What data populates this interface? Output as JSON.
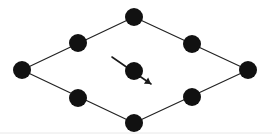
{
  "figure": {
    "name": "rhombic-lattice-unit-cell",
    "type": "diagram",
    "title": "",
    "width": 272,
    "height": 140,
    "background_color": "#ffffff"
  },
  "style": {
    "node_color": "#111111",
    "node_radius": 9,
    "edge_color": "#222222",
    "edge_width": 1.2,
    "arrow_color": "#1a1a1a",
    "arrow_width": 1.6,
    "baseline_color": "#e8e8e8"
  },
  "geometry": {
    "vertices": [
      {
        "id": "top",
        "label": "top-vertex",
        "x": 134,
        "y": 17
      },
      {
        "id": "right",
        "label": "right-vertex",
        "x": 248,
        "y": 70
      },
      {
        "id": "bottom",
        "label": "bottom-vertex",
        "x": 134,
        "y": 123
      },
      {
        "id": "left",
        "label": "left-vertex",
        "x": 22,
        "y": 70
      }
    ],
    "midpoints": [
      {
        "id": "upper-left",
        "label": "upper-left-edge-node",
        "x": 78,
        "y": 43
      },
      {
        "id": "upper-right",
        "label": "upper-right-edge-node",
        "x": 192,
        "y": 44
      },
      {
        "id": "lower-right",
        "label": "lower-right-edge-node",
        "x": 192,
        "y": 97
      },
      {
        "id": "lower-left",
        "label": "lower-left-edge-node",
        "x": 78,
        "y": 98
      }
    ],
    "center_node": {
      "id": "center",
      "label": "center-node",
      "x": 134,
      "y": 71
    },
    "edges": [
      {
        "id": "edge-top-left",
        "from": "left",
        "to": "top"
      },
      {
        "id": "edge-top-right",
        "from": "top",
        "to": "right"
      },
      {
        "id": "edge-bottom-right",
        "from": "right",
        "to": "bottom"
      },
      {
        "id": "edge-bottom-left",
        "from": "bottom",
        "to": "left"
      }
    ],
    "arrow": {
      "id": "center-direction-arrow",
      "label": "direction-arrow",
      "x1": 112,
      "y1": 57,
      "x2": 151,
      "y2": 84,
      "head_size": 6,
      "direction": "down-right"
    },
    "baseline": {
      "y": 133,
      "x1": 0,
      "x2": 272
    }
  }
}
